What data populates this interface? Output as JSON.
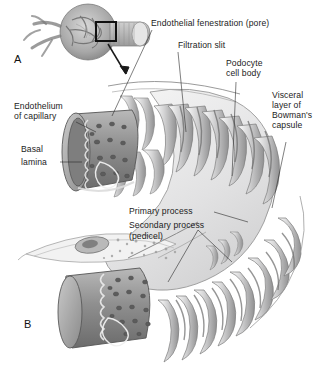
{
  "figure": {
    "panels": [
      {
        "id": "A",
        "label": "A",
        "caption": "Renal corpuscle overview with boxed region of interest"
      },
      {
        "id": "B",
        "label": "B",
        "caption": "Enlarged view of glomerular capillary and podocyte"
      }
    ],
    "colors": {
      "background": "#ffffff",
      "text": "#1c1c1c",
      "leader_line": "#2a2a2a",
      "capillary_fill": "#9a9a9a",
      "capillary_dark": "#6f6f6f",
      "pore_fill": "#5f5f5f",
      "podocyte_fill": "#ececed",
      "process_shade": "#8c8c8c",
      "outline": "#4a4a4a"
    }
  },
  "labels": {
    "endothelial_fenestration": "Endothelial fenestration (pore)",
    "filtration_slit": "Filtration slit",
    "podocyte_cell_body_line1": "Podocyte",
    "podocyte_cell_body_line2": "cell body",
    "visceral_layer_line1": "Visceral",
    "visceral_layer_line2": "layer of",
    "visceral_layer_line3": "Bowman's",
    "visceral_layer_line4": "capsule",
    "endothelium_line1": "Endothelium",
    "endothelium_line2": "of capillary",
    "basal_lamina_line1": "Basal",
    "basal_lamina_line2": "lamina",
    "primary_process": "Primary process",
    "secondary_process_line1": "Secondary process",
    "secondary_process_line2": "(pedicel)"
  }
}
